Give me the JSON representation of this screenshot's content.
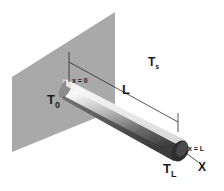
{
  "diagram": {
    "labels": {
      "ambient_temp": "T",
      "ambient_temp_sub": "s",
      "base_temp": "T",
      "base_temp_sub": "0",
      "tip_temp": "T",
      "tip_temp_sub": "L",
      "length": "L",
      "x_start": "x = 0",
      "x_end": "x = L",
      "axis": "X"
    },
    "colors": {
      "wall": "#a9a9a9",
      "rod_light": "#f2f2f2",
      "rod_dark": "#4a4a4a",
      "rod_end": "#2e2e2e",
      "line": "#2a2a2a"
    }
  }
}
